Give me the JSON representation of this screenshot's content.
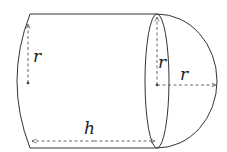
{
  "diagram": {
    "labels": {
      "left_radius": "r",
      "ellipse_radius": "r",
      "cap_radius": "r",
      "height": "h"
    },
    "colors": {
      "stroke": "#333333",
      "dash": "#555555",
      "background": "#ffffff"
    }
  }
}
